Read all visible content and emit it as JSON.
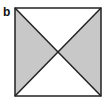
{
  "figure": {
    "panel_label": "b",
    "shape": "square with both diagonals",
    "square": {
      "x": 15,
      "y": 8,
      "width": 86,
      "height": 88
    },
    "shaded_regions": [
      "left-triangle",
      "right-triangle"
    ],
    "unshaded_regions": [
      "top-triangle",
      "bottom-triangle"
    ],
    "colors": {
      "shade": "#c8c8c8",
      "stroke": "#222222",
      "background": "#ffffff"
    }
  }
}
